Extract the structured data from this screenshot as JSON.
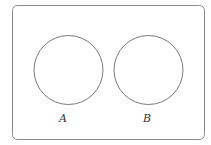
{
  "diagram": {
    "type": "venn",
    "universe": {
      "x": 12.5,
      "y": 5.5,
      "width": 192,
      "height": 134,
      "corner_radius": 5,
      "stroke": "#8a8a8a"
    },
    "sets": [
      {
        "label": "A",
        "cx": 68.5,
        "cy": 70,
        "r": 34.5,
        "label_x": 59,
        "label_y": 122,
        "stroke": "#7a7a7a"
      },
      {
        "label": "B",
        "cx": 148.5,
        "cy": 70,
        "r": 34.5,
        "label_x": 143,
        "label_y": 122,
        "stroke": "#7a7a7a"
      }
    ],
    "relationship": "disjoint"
  }
}
